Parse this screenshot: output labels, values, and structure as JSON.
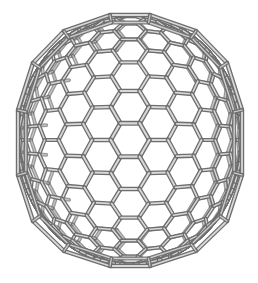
{
  "image": {
    "subject": "fullerene-cage-wireframe",
    "description": "Gray tube-rendered wireframe of an icosahedral fullerene cage with hexagonal and pentagonal faces on a white background",
    "background_color": "#ffffff",
    "tube_color": "#9a9a9a",
    "tube_highlight": "#d8d8d8",
    "tube_shadow": "#6e6e6e",
    "bounds": {
      "left": 15,
      "top": 13,
      "right": 245,
      "bottom": 268
    },
    "center": {
      "x": 130,
      "y": 140
    },
    "hex_radius": 19
  },
  "caption": {
    "text": "",
    "legible": false
  }
}
